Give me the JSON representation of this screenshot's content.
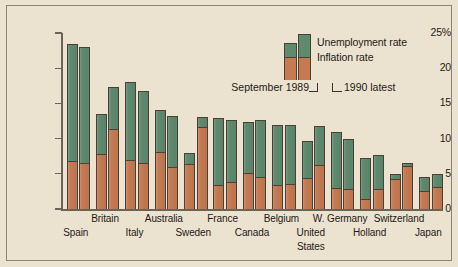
{
  "chart_data": {
    "type": "bar",
    "title": "",
    "xlabel": "",
    "ylabel": "",
    "ylim": [
      0,
      25
    ],
    "grid": false,
    "legend_position": "top-right",
    "y_axis": {
      "ticks": [
        0,
        5,
        10,
        15,
        20,
        25
      ],
      "tick_labels": [
        "0",
        "5",
        "10",
        "15",
        "20",
        "25%"
      ]
    },
    "categories": [
      "Spain",
      "Britain",
      "Italy",
      "Australia",
      "Sweden",
      "France",
      "Canada",
      "Belgium",
      "United States",
      "W. Germany",
      "Holland",
      "Switzerland",
      "Japan"
    ],
    "series": [
      {
        "name": "Unemployment rate",
        "color": "#5e8a6e",
        "sub_series": [
          {
            "period": "September 1989",
            "values": [
              16.7,
              5.7,
              11.1,
              5.9,
              1.6,
              9.5,
              7.3,
              8.5,
              5.3,
              7.9,
              5.8,
              0.7,
              2.1
            ]
          },
          {
            "period": "1990 latest",
            "values": [
              16.4,
              6.0,
              10.2,
              7.2,
              1.4,
              8.9,
              8.2,
              8.4,
              5.6,
              7.2,
              4.9,
              0.5,
              1.9
            ]
          }
        ]
      },
      {
        "name": "Inflation rate",
        "color": "#c57a52",
        "sub_series": [
          {
            "period": "September 1989",
            "values": [
              6.8,
              7.8,
              6.9,
              8.1,
              6.4,
              3.4,
              5.1,
              3.4,
              4.4,
              3.0,
              1.4,
              4.3,
              2.5
            ]
          },
          {
            "period": "1990 latest",
            "values": [
              6.6,
              11.3,
              6.6,
              6.0,
              11.6,
              3.8,
              4.5,
              3.6,
              6.2,
              2.8,
              2.8,
              6.1,
              3.1
            ]
          }
        ]
      }
    ],
    "totals": {
      "september_1989": [
        23.5,
        13.5,
        18.0,
        14.0,
        8.0,
        12.9,
        12.4,
        11.9,
        9.7,
        10.9,
        7.2,
        5.0,
        4.6
      ],
      "latest_1990": [
        23.0,
        17.3,
        16.8,
        13.2,
        13.0,
        12.7,
        12.7,
        12.0,
        11.8,
        10.0,
        7.7,
        6.6,
        5.0
      ]
    },
    "annotations": [
      "September 1989",
      "1990 latest"
    ]
  },
  "legend": {
    "unemployment_label": "Unemployment rate",
    "inflation_label": "Inflation rate",
    "left_note": "September 1989",
    "right_note": "1990 latest"
  },
  "colors": {
    "unemployment": "#5e8a6e",
    "inflation": "#c57a52",
    "background": "#ece2d0",
    "axis": "#6b6258",
    "outline": "#4a4038"
  }
}
